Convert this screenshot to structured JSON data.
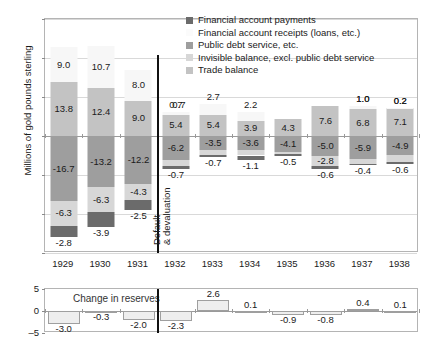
{
  "chart_data": {
    "type": "bar",
    "title": "",
    "subtype": "stacked-bar-with-subpanel",
    "xlabel": "",
    "ylabel": "Millions of gold pounds sterling",
    "ylim": [
      -30,
      30
    ],
    "yticks": [
      30,
      20,
      10,
      0,
      -10,
      -20,
      -30
    ],
    "grid": true,
    "legend_position": "top-right",
    "categories": [
      "1929",
      "1930",
      "1931",
      "1932",
      "1933",
      "1934",
      "1935",
      "1936",
      "1937",
      "1938"
    ],
    "series": [
      {
        "name": "Financial account payments",
        "color": "#6b6b6b",
        "values": [
          -2.8,
          -3.9,
          -2.5,
          -0.7,
          -0.7,
          -1.1,
          -0.5,
          -0.6,
          -0.4,
          -0.6
        ]
      },
      {
        "name": "Financial account receipts (loans, etc.)",
        "color": "#f7f7f7",
        "values": [
          9.0,
          10.7,
          8.0,
          0.7,
          2.7,
          2.2,
          null,
          null,
          1.0,
          0.2
        ]
      },
      {
        "name": "Public debt service, etc.",
        "color": "#9e9e9e",
        "values": [
          -16.7,
          -13.2,
          -12.2,
          -6.2,
          -3.5,
          -3.6,
          -4.1,
          -5.0,
          -5.9,
          -4.9
        ]
      },
      {
        "name": "Invisible balance, excl. public debt service",
        "color": "#d7d7d7",
        "values": [
          -6.3,
          -6.3,
          -4.3,
          -1.5,
          -1.3,
          -1.4,
          -0.6,
          -2.8,
          -1.2,
          -1.7
        ]
      },
      {
        "name": "Trade balance",
        "color": "#c3c3c3",
        "values": [
          13.8,
          12.4,
          9.0,
          5.4,
          5.4,
          3.9,
          4.3,
          7.6,
          6.8,
          7.1
        ]
      }
    ],
    "annotations": [
      {
        "text": "Default & devaluation",
        "at_category": "1932",
        "type": "vertical-divider-label"
      }
    ],
    "subpanel": {
      "title": "Change in reserves",
      "ylim": [
        -5,
        5
      ],
      "yticks": [
        5,
        0,
        -5
      ],
      "values": [
        -3.0,
        -0.3,
        -2.0,
        -2.3,
        2.6,
        0.1,
        -0.9,
        -0.8,
        0.4,
        0.1
      ],
      "bar_color": "#eeeeee",
      "bar_border": "#9f9f9f"
    }
  },
  "legend": {
    "items": [
      {
        "label": "Financial account payments",
        "swatch": "#6b6b6b",
        "border": "#6b6b6b"
      },
      {
        "label": "Financial account receipts (loans, etc.)",
        "swatch": "#fbfbfb",
        "border": "#fbfbfb"
      },
      {
        "label": "Public debt service, etc.",
        "swatch": "#9e9e9e",
        "border": "#9e9e9e"
      },
      {
        "label": "Invisible balance, excl. public debt service",
        "swatch": "#d7d7d7",
        "border": "#d7d7d7"
      },
      {
        "label": "Trade balance",
        "swatch": "#c3c3c3",
        "border": "#c3c3c3"
      }
    ]
  },
  "axes": {
    "y_title": "Millions of gold pounds sterling",
    "y_tick_labels": [
      "30",
      "20",
      "10",
      "0",
      "–10",
      "–20",
      "–30"
    ],
    "x_tick_labels": [
      "1929",
      "1930",
      "1931",
      "1932",
      "1933",
      "1934",
      "1935",
      "1936",
      "1937",
      "1938"
    ],
    "reserves_tick_labels": [
      "5",
      "0",
      "–5"
    ]
  },
  "annotation": {
    "default_devaluation": "Default\n& devaluation",
    "default_line1": "Default",
    "default_line2": "& devaluation"
  },
  "reserves": {
    "title": "Change in reserves",
    "labels": [
      "-3.0",
      "-0.3",
      "-2.0",
      "-2.3",
      "2.6",
      "0.1",
      "-0.9",
      "-0.8",
      "0.4",
      "0.1"
    ]
  },
  "bar_labels": {
    "1929": {
      "receipts": "9.0",
      "trade": "13.8",
      "debt": "-16.7",
      "invisible": "-6.3",
      "payments": "-2.8"
    },
    "1930": {
      "receipts": "10.7",
      "trade": "12.4",
      "debt": "-13.2",
      "invisible": "-6.3",
      "payments": "-3.9"
    },
    "1931": {
      "receipts": "8.0",
      "trade": "9.0",
      "debt": "-12.2",
      "invisible": "-4.3",
      "payments": "-2.5"
    },
    "1932": {
      "receipts": "0.7",
      "trade": "5.4",
      "debt": "-6.2",
      "invisible": "-1.5",
      "payments": "-0.7"
    },
    "1933": {
      "receipts": "2.7",
      "trade": "5.4",
      "debt": "-3.5",
      "invisible": "-1.3",
      "payments": "-0.7"
    },
    "1934": {
      "receipts": "2.2",
      "trade": "3.9",
      "debt": "-3.6",
      "invisible": "-1.4",
      "payments": "-1.1"
    },
    "1935": {
      "receipts": "",
      "trade": "4.3",
      "debt": "-4.1",
      "invisible": "-0.6",
      "payments": "-0.5"
    },
    "1936": {
      "receipts": "",
      "trade": "7.6",
      "debt": "-5.0",
      "invisible": "-2.8",
      "payments": "-0.6"
    },
    "1937": {
      "receipts": "1.0",
      "trade": "6.8",
      "debt": "-5.9",
      "invisible": "-1.2",
      "payments": "-0.4"
    },
    "1938": {
      "receipts": "0.2",
      "trade": "7.1",
      "debt": "-4.9",
      "invisible": "-1.7",
      "payments": "-0.6"
    }
  }
}
